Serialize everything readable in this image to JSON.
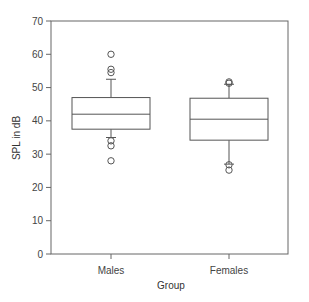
{
  "chart_data": {
    "type": "box",
    "title": "",
    "xlabel": "Group",
    "ylabel": "SPL in dB",
    "ylim": [
      0,
      70
    ],
    "yticks": [
      0,
      10,
      20,
      30,
      40,
      50,
      60,
      70
    ],
    "categories": [
      "Males",
      "Females"
    ],
    "grid": false,
    "legend": null,
    "series": [
      {
        "name": "Males",
        "whisker_low": 35,
        "q1": 37.5,
        "median": 42,
        "q3": 47,
        "whisker_high": 52.5,
        "outliers": [
          60,
          55.5,
          54.5,
          34,
          32.5,
          28
        ]
      },
      {
        "name": "Females",
        "whisker_low": 27,
        "q1": 34.2,
        "median": 40.5,
        "q3": 46.8,
        "whisker_high": 51,
        "outliers": [
          51.7,
          51.3,
          26.8,
          25.2
        ]
      }
    ]
  },
  "style": {
    "line_color": "#555555",
    "axis_color": "#666666"
  }
}
